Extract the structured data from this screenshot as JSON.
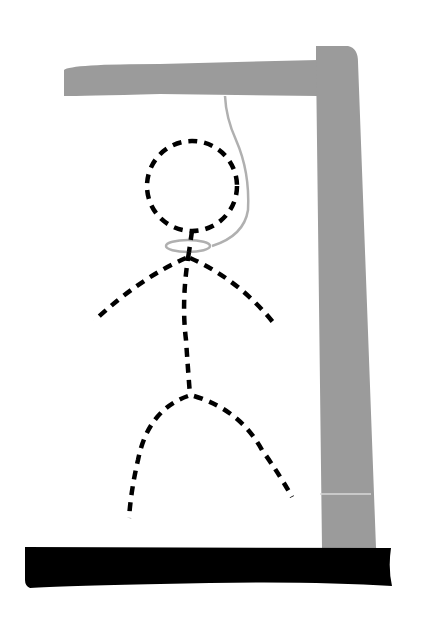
{
  "scene": {
    "title": "Hangman",
    "description": "Hangman gallows with dashed stick figure",
    "background": "#ffffff"
  },
  "gallows": {
    "beam_color": "#9b9b9b",
    "post_color": "#9b9b9b",
    "base_color": "#000000",
    "rope_color": "#b0b0b0"
  },
  "figure": {
    "stroke_color": "#000000",
    "parts": [
      "head",
      "body",
      "left-arm",
      "right-arm",
      "left-leg",
      "right-leg"
    ],
    "style": "dashed"
  }
}
